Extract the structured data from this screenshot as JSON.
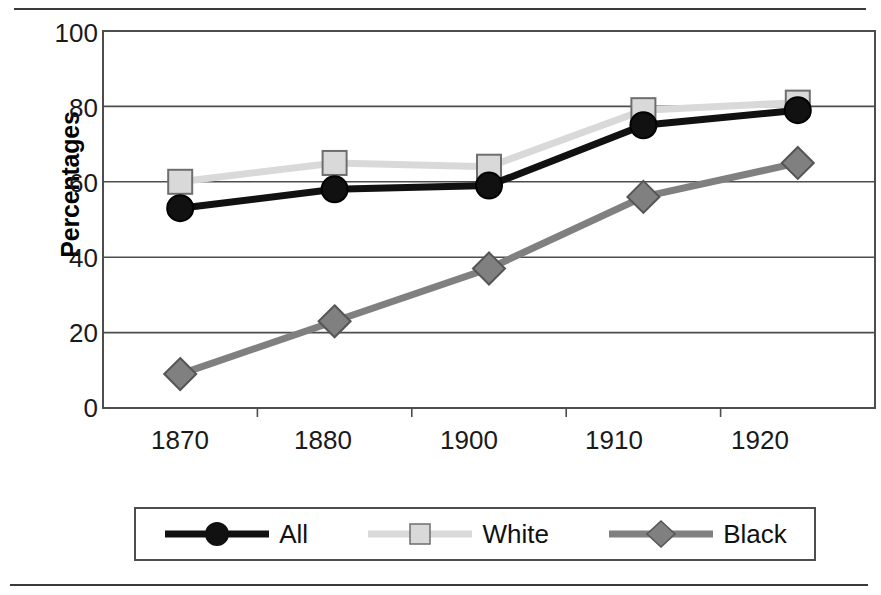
{
  "chart_data": {
    "type": "line",
    "title": "",
    "xlabel": "",
    "ylabel": "Percentages",
    "categories": [
      "1870",
      "1880",
      "1900",
      "1910",
      "1920"
    ],
    "ylim": [
      0,
      100
    ],
    "yticks": [
      0,
      20,
      40,
      60,
      80,
      100
    ],
    "grid": true,
    "legend_position": "bottom",
    "series": [
      {
        "name": "All",
        "marker": "circle",
        "color": "#111111",
        "values": [
          53,
          58,
          59,
          75,
          79
        ]
      },
      {
        "name": "White",
        "marker": "square",
        "color": "#d9d9d9",
        "values": [
          60,
          65,
          64,
          79,
          81
        ]
      },
      {
        "name": "Black",
        "marker": "diamond",
        "color": "#808080",
        "values": [
          9,
          23,
          37,
          56,
          65
        ]
      }
    ]
  },
  "axis": {
    "y_tick_labels": [
      "100",
      "80",
      "60",
      "40",
      "20",
      "0"
    ],
    "x_tick_labels": [
      "1870",
      "1880",
      "1900",
      "1910",
      "1920"
    ],
    "y_axis_title": "Percentages"
  },
  "legend": {
    "items": [
      {
        "label": "All",
        "marker": "circle",
        "color": "#111111"
      },
      {
        "label": "White",
        "marker": "square",
        "color": "#d9d9d9"
      },
      {
        "label": "Black",
        "marker": "diamond",
        "color": "#808080"
      }
    ]
  },
  "colors": {
    "all_series": "#111111",
    "white_series": "#d9d9d9",
    "black_series": "#808080",
    "axis": "#4d4d4d",
    "grid": "#4d4d4d",
    "rule": "#3a3a3a"
  }
}
